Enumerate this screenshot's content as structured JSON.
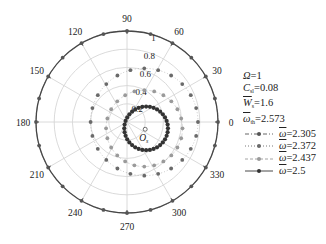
{
  "chart_data": {
    "type": "polar-scatter",
    "title": "",
    "angular_ticks": [
      0,
      30,
      60,
      90,
      120,
      150,
      180,
      210,
      240,
      270,
      300,
      330
    ],
    "radial_ticks": [
      0.2,
      0.4,
      0.6,
      0.8,
      1
    ],
    "radial_range": [
      0,
      1
    ],
    "grid": true,
    "center_label": "O",
    "center_label_subscript": "s",
    "parameters": [
      {
        "symbol": "Ω",
        "subscript": "",
        "overline": false,
        "value": "1"
      },
      {
        "symbol": "C",
        "subscript": "sl",
        "overline": false,
        "value": "0.08"
      },
      {
        "symbol": "W",
        "subscript": "s",
        "overline": true,
        "value": "1.6"
      },
      {
        "symbol": "ω",
        "subscript": "th",
        "overline": true,
        "value": "2.573"
      }
    ],
    "series": [
      {
        "name": "ω̄=2.305",
        "symbol": "ω",
        "value": "2.305",
        "line": "dash-dot",
        "color": "#555555",
        "shape": "circle",
        "center": [
          0,
          0
        ],
        "radius": 1.0,
        "points": 24
      },
      {
        "name": "ω̄=2.372",
        "symbol": "ω",
        "value": "2.372",
        "line": "dotted",
        "color": "#6a6a6a",
        "shape": "circle",
        "center": [
          0.19,
          0.0
        ],
        "radius": 0.59,
        "points": 24
      },
      {
        "name": "ω̄=2.437",
        "symbol": "ω",
        "value": "2.437",
        "line": "dashed",
        "color": "#9a9a9a",
        "shape": "circle",
        "center": [
          0.19,
          -0.07
        ],
        "radius": 0.42,
        "points": 24
      },
      {
        "name": "ω̄=2.5",
        "symbol": "ω",
        "value": "2.5",
        "line": "solid",
        "color": "#333333",
        "shape": "circle",
        "center": [
          0.21,
          -0.07
        ],
        "radius": 0.24,
        "points": 36
      }
    ],
    "legend_position": "right"
  },
  "layout": {
    "cx": 127,
    "cy": 122,
    "R": 91
  }
}
